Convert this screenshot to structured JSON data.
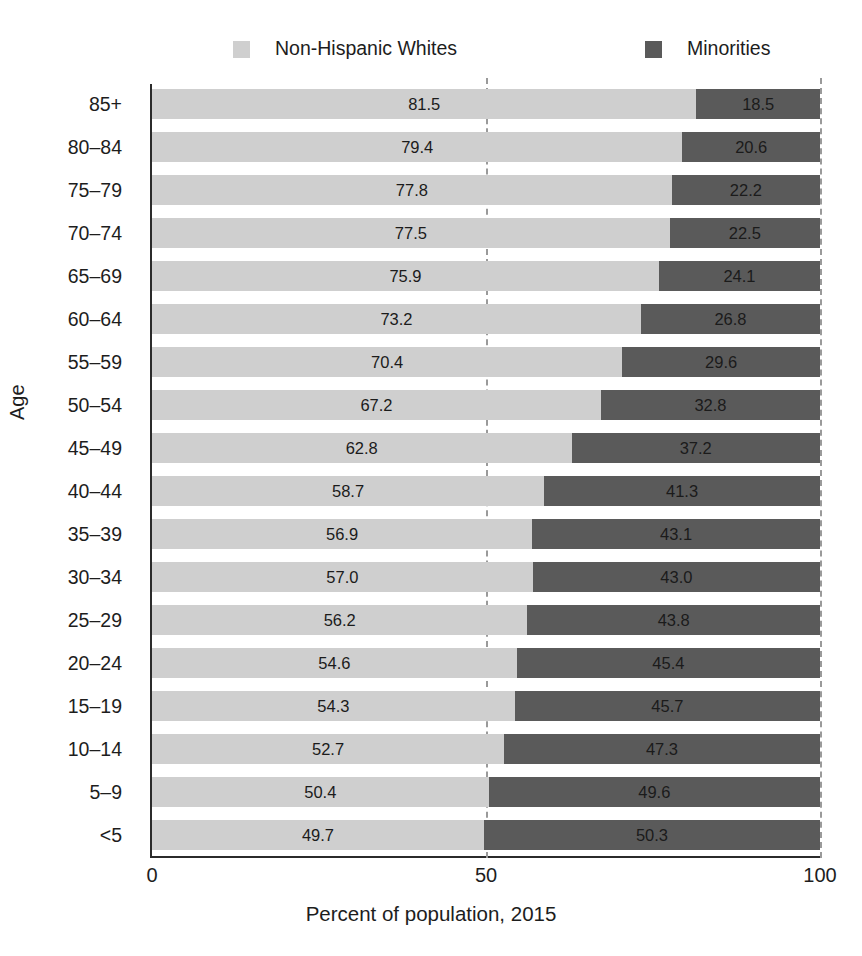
{
  "legend": {
    "items": [
      {
        "label": "Non-Hispanic Whites",
        "color": "#cfcfcf",
        "swatch_name": "legend-swatch-non-hispanic-whites"
      },
      {
        "label": "Minorities",
        "color": "#5a5a5a",
        "swatch_name": "legend-swatch-minorities"
      }
    ]
  },
  "axes": {
    "y_title": "Age",
    "x_title": "Percent of population, 2015",
    "x_ticks": [
      "0",
      "50",
      "100"
    ]
  },
  "chart_data": {
    "type": "bar",
    "orientation": "horizontal",
    "stacked": true,
    "normalized": true,
    "title": "",
    "subtitle": "",
    "xlabel": "Percent of population, 2015",
    "ylabel": "Age",
    "xlim": [
      0,
      100
    ],
    "xticks": [
      0,
      50,
      100
    ],
    "grid": "vertical dashed gridlines at 50 and 100",
    "legend_position": "top",
    "categories": [
      "85+",
      "80–84",
      "75–79",
      "70–74",
      "65–69",
      "60–64",
      "55–59",
      "50–54",
      "45–49",
      "40–44",
      "35–39",
      "30–34",
      "25–29",
      "20–24",
      "15–19",
      "10–14",
      "5–9",
      "<5"
    ],
    "series": [
      {
        "name": "Non-Hispanic Whites",
        "color": "#cfcfcf",
        "values": [
          81.5,
          79.4,
          77.8,
          77.5,
          75.9,
          73.2,
          70.4,
          67.2,
          62.8,
          58.7,
          56.9,
          57.0,
          56.2,
          54.6,
          54.3,
          52.7,
          50.4,
          49.7
        ],
        "labels": [
          "81.5",
          "79.4",
          "77.8",
          "77.5",
          "75.9",
          "73.2",
          "70.4",
          "67.2",
          "62.8",
          "58.7",
          "56.9",
          "57.0",
          "56.2",
          "54.6",
          "54.3",
          "52.7",
          "50.4",
          "49.7"
        ]
      },
      {
        "name": "Minorities",
        "color": "#5a5a5a",
        "values": [
          18.5,
          20.6,
          22.2,
          22.5,
          24.1,
          26.8,
          29.6,
          32.8,
          37.2,
          41.3,
          43.1,
          43.0,
          43.8,
          45.4,
          45.7,
          47.3,
          49.6,
          50.3
        ],
        "labels": [
          "18.5",
          "20.6",
          "22.2",
          "22.5",
          "24.1",
          "26.8",
          "29.6",
          "32.8",
          "37.2",
          "41.3",
          "43.1",
          "43.0",
          "43.8",
          "45.4",
          "45.7",
          "47.3",
          "49.6",
          "50.3"
        ]
      }
    ]
  }
}
